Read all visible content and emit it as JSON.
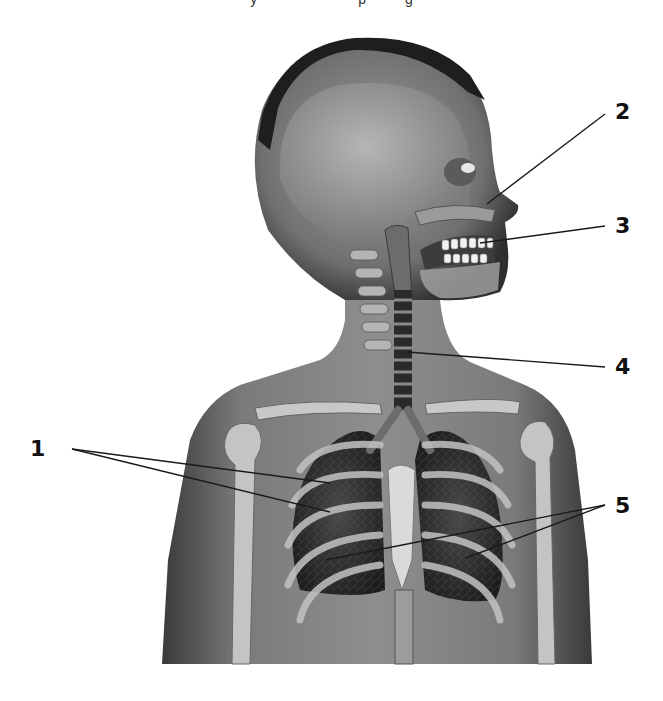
{
  "diagram": {
    "type": "labeled-anatomy-illustration",
    "top_clipped_text": "y                          p          g",
    "colors": {
      "background": "#ffffff",
      "skin": "#7d7d7d",
      "skin_dark": "#3e3e3e",
      "hair": "#1e1e1e",
      "bone": "#cfcfcf",
      "lung": "#2c2c2c",
      "leader_line": "#1a1a1a",
      "label_text": "#111111"
    },
    "labels": [
      {
        "id": "1",
        "text": "1",
        "x": 30,
        "y": 438,
        "leaders": [
          {
            "from": [
              72,
              449
            ],
            "to": [
              330,
              483
            ]
          },
          {
            "from": [
              72,
              449
            ],
            "to": [
              330,
              512
            ]
          }
        ]
      },
      {
        "id": "2",
        "text": "2",
        "x": 615,
        "y": 101,
        "leaders": [
          {
            "from": [
              605,
              114
            ],
            "to": [
              487,
              204
            ]
          }
        ]
      },
      {
        "id": "3",
        "text": "3",
        "x": 615,
        "y": 215,
        "leaders": [
          {
            "from": [
              605,
              226
            ],
            "to": [
              480,
              243
            ]
          }
        ]
      },
      {
        "id": "4",
        "text": "4",
        "x": 615,
        "y": 356,
        "leaders": [
          {
            "from": [
              605,
              367
            ],
            "to": [
              407,
              352
            ]
          }
        ]
      },
      {
        "id": "5",
        "text": "5",
        "x": 615,
        "y": 495,
        "leaders": [
          {
            "from": [
              605,
              505
            ],
            "to": [
              326,
              560
            ]
          },
          {
            "from": [
              605,
              505
            ],
            "to": [
              466,
              558
            ]
          }
        ]
      }
    ]
  }
}
